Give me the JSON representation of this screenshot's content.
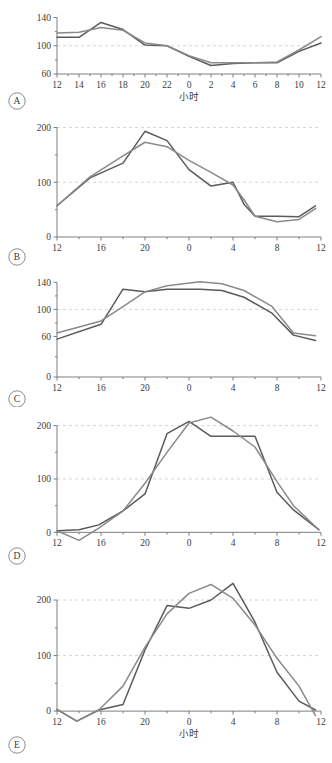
{
  "figure": {
    "title": "",
    "background_color": "#ffffff",
    "axis_color": "#6f6f6f",
    "grid_color": "#c9c9d8",
    "series_colors": {
      "observed": "#5a5a5a",
      "modeled": "#8a8a8a"
    },
    "xlabel": "小时",
    "panel_labels": [
      "A",
      "B",
      "C",
      "D",
      "E"
    ]
  },
  "chart_data": [
    {
      "type": "line",
      "panel": "A",
      "title": "",
      "xlabel": "小时",
      "ylabel": "",
      "xticklabels": [
        "12",
        "14",
        "16",
        "18",
        "20",
        "22",
        "0",
        "2",
        "4",
        "6",
        "8",
        "10",
        "12"
      ],
      "x": [
        12,
        14,
        16,
        18,
        20,
        22,
        24,
        26,
        28,
        30,
        32,
        34,
        36
      ],
      "xlim": [
        12,
        36
      ],
      "ylim": [
        60,
        145
      ],
      "yticks": [
        60,
        100,
        140
      ],
      "yticklabels": [
        "60",
        "100",
        "140"
      ],
      "gridlines": [
        100
      ],
      "legend": "none",
      "series": [
        {
          "name": "observed",
          "color": "#5a5a5a",
          "values": [
            112,
            112,
            133,
            123,
            101,
            100,
            85,
            72,
            75,
            76,
            76,
            92,
            104
          ]
        },
        {
          "name": "modeled",
          "color": "#8a8a8a",
          "values": [
            118,
            119,
            126,
            122,
            104,
            100,
            86,
            76,
            76,
            76,
            77,
            94,
            113
          ]
        }
      ]
    },
    {
      "type": "line",
      "panel": "B",
      "title": "",
      "xlabel": "",
      "ylabel": "",
      "xticklabels": [
        "12",
        "16",
        "20",
        "0",
        "4",
        "8",
        "12"
      ],
      "x": [
        12,
        16,
        20,
        24,
        28,
        32,
        36
      ],
      "xlim": [
        12,
        36
      ],
      "ylim": [
        0,
        210
      ],
      "yticks": [
        0,
        100,
        200
      ],
      "yticklabels": [
        "0",
        "100",
        "200"
      ],
      "gridlines": [
        100,
        200
      ],
      "legend": "none",
      "series": [
        {
          "name": "observed",
          "color": "#5a5a5a",
          "values": [
            57,
            108,
            135,
            193,
            176,
            123,
            93,
            100,
            60,
            38,
            38,
            37,
            57
          ],
          "x_fine": [
            12,
            15,
            18,
            20,
            22,
            24,
            26,
            28,
            29,
            30,
            32,
            34,
            35.5
          ]
        },
        {
          "name": "modeled",
          "color": "#8a8a8a",
          "values": [
            57,
            110,
            148,
            173,
            165,
            140,
            118,
            95,
            68,
            38,
            28,
            32,
            52
          ],
          "x_fine": [
            12,
            15,
            18,
            20,
            22,
            24,
            26,
            28,
            29,
            30,
            32,
            34,
            35.5
          ]
        }
      ]
    },
    {
      "type": "line",
      "panel": "C",
      "title": "",
      "xlabel": "",
      "ylabel": "",
      "xticklabels": [
        "12",
        "16",
        "20",
        "0",
        "4",
        "8",
        "12"
      ],
      "x": [
        12,
        16,
        20,
        24,
        28,
        32,
        36
      ],
      "xlim": [
        12,
        36
      ],
      "ylim": [
        0,
        148
      ],
      "yticks": [
        0,
        60,
        100,
        140
      ],
      "yticklabels": [
        "0",
        "60",
        "100",
        "140"
      ],
      "gridlines": [
        100
      ],
      "legend": "none",
      "series": [
        {
          "name": "observed",
          "color": "#5a5a5a",
          "values": [
            56,
            78,
            130,
            126,
            130,
            130,
            128,
            118,
            95,
            62,
            54
          ],
          "x_fine": [
            12,
            16,
            18,
            20,
            22,
            25,
            27,
            29,
            31.5,
            33.5,
            35.5
          ]
        },
        {
          "name": "modeled",
          "color": "#8a8a8a",
          "values": [
            65,
            83,
            104,
            126,
            135,
            141,
            138,
            128,
            105,
            65,
            61
          ],
          "x_fine": [
            12,
            16,
            18,
            20,
            22,
            25,
            27,
            29,
            31.5,
            33.5,
            35.5
          ]
        }
      ]
    },
    {
      "type": "line",
      "panel": "D",
      "title": "",
      "xlabel": "",
      "ylabel": "",
      "xticklabels": [
        "12",
        "16",
        "20",
        "0",
        "4",
        "8",
        "12"
      ],
      "x": [
        12,
        16,
        20,
        24,
        28,
        32,
        36
      ],
      "xlim": [
        12,
        36
      ],
      "ylim": [
        -20,
        220
      ],
      "yticks": [
        0,
        100,
        200
      ],
      "yticklabels": [
        "0",
        "100",
        "200"
      ],
      "gridlines": [
        100,
        200
      ],
      "legend": "none",
      "series": [
        {
          "name": "observed",
          "color": "#5a5a5a",
          "values": [
            3,
            5,
            14,
            40,
            72,
            185,
            208,
            180,
            180,
            180,
            75,
            42,
            5
          ],
          "x_fine": [
            12,
            14,
            15.8,
            18,
            20,
            22,
            24,
            26,
            28,
            30,
            32,
            33.5,
            35.8
          ]
        },
        {
          "name": "modeled",
          "color": "#8a8a8a",
          "values": [
            3,
            -15,
            8,
            40,
            92,
            150,
            205,
            216,
            190,
            160,
            95,
            50,
            5
          ],
          "x_fine": [
            12,
            14,
            15.8,
            18,
            20,
            22,
            24,
            26,
            28,
            30,
            32,
            33.5,
            35.8
          ]
        }
      ]
    },
    {
      "type": "line",
      "panel": "E",
      "title": "",
      "xlabel": "小时",
      "ylabel": "",
      "xticklabels": [
        "12",
        "16",
        "20",
        "0",
        "4",
        "8",
        "12"
      ],
      "x": [
        12,
        16,
        20,
        24,
        28,
        32,
        36
      ],
      "xlim": [
        12,
        36
      ],
      "ylim": [
        -25,
        245
      ],
      "yticks": [
        0,
        100,
        200
      ],
      "yticklabels": [
        "0",
        "100",
        "200"
      ],
      "gridlines": [
        100,
        200
      ],
      "legend": "none",
      "series": [
        {
          "name": "observed",
          "color": "#5a5a5a",
          "values": [
            3,
            -18,
            2,
            12,
            110,
            190,
            185,
            200,
            230,
            160,
            70,
            18,
            2
          ],
          "x_fine": [
            12,
            13.8,
            15.8,
            18,
            20,
            22,
            24,
            26,
            28,
            30,
            32,
            34,
            35.5
          ]
        },
        {
          "name": "modeled",
          "color": "#8a8a8a",
          "values": [
            3,
            -18,
            2,
            45,
            115,
            175,
            212,
            228,
            203,
            155,
            95,
            45,
            -8
          ],
          "x_fine": [
            12,
            13.8,
            15.8,
            18,
            20,
            22,
            24,
            26,
            28,
            30,
            32,
            34,
            35.5
          ]
        }
      ]
    }
  ]
}
